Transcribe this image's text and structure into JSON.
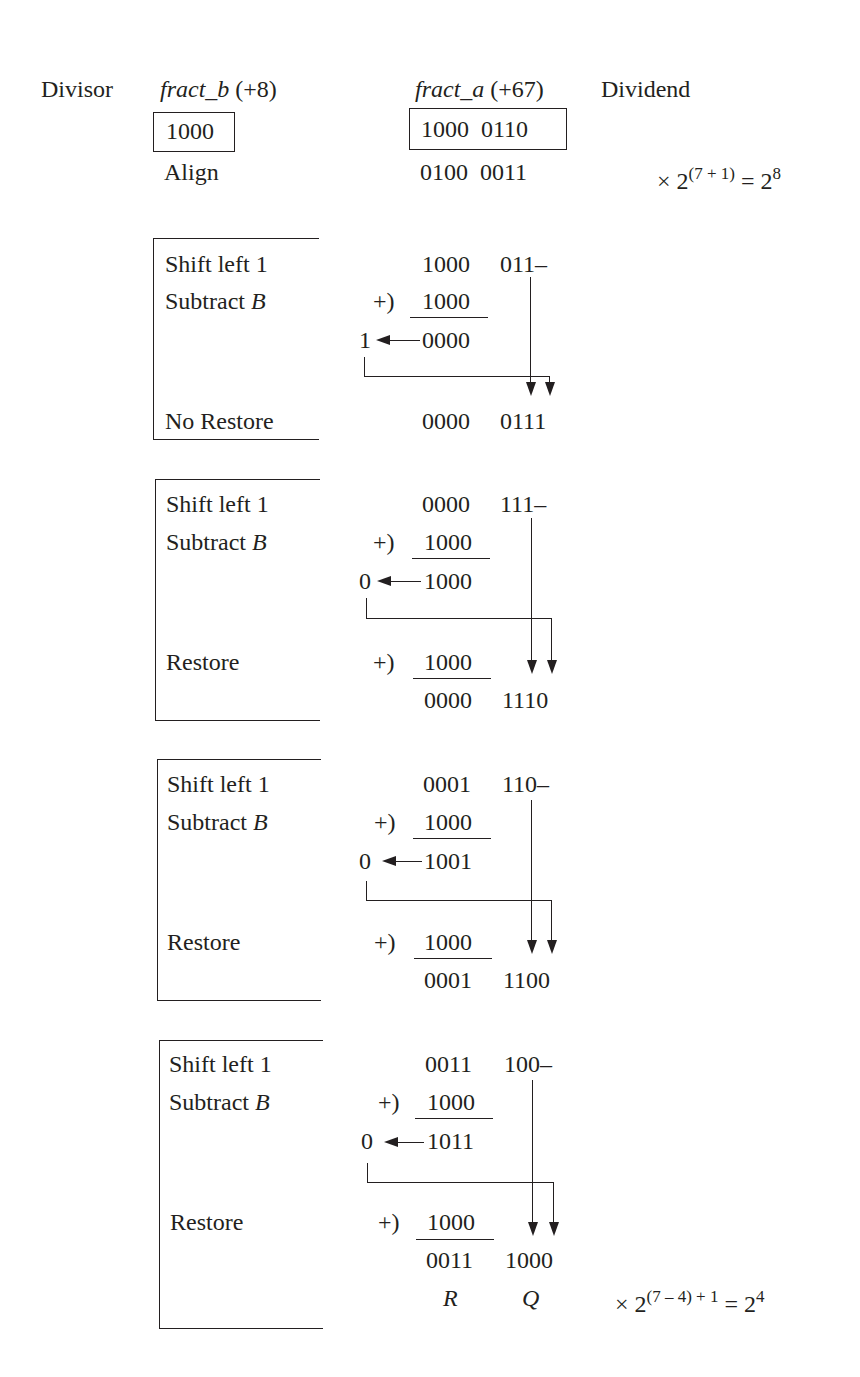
{
  "header": {
    "divisor_label": "Divisor",
    "dividend_label": "Dividend",
    "fract_b_name": "fract_b",
    "fract_b_value": "(+8)",
    "fract_a_name": "fract_a",
    "fract_a_value": "(+67)",
    "divisor_bits": "1000",
    "dividend_bits": "1000  0110",
    "align_label": "Align",
    "aligned_bits": "0100  0011",
    "scale_prefix": "× 2",
    "scale_exp": "(7 + 1)",
    "scale_eq": " = 2",
    "scale_result_exp": "8"
  },
  "steps": [
    {
      "shift_label": "Shift left 1",
      "subtract_label": "Subtract ",
      "subtract_var": "B",
      "shifted_hi": "1000",
      "shifted_lo": "011–",
      "add_op": "+)",
      "addend": "1000",
      "carry": "1",
      "sum": "0000",
      "restore_label": "No Restore",
      "restore_addend": "",
      "result_hi": "0000",
      "result_lo": "0111"
    },
    {
      "shift_label": "Shift left 1",
      "subtract_label": "Subtract ",
      "subtract_var": "B",
      "shifted_hi": "0000",
      "shifted_lo": "111–",
      "add_op": "+)",
      "addend": "1000",
      "carry": "0",
      "sum": "1000",
      "restore_label": "Restore",
      "restore_addend": "1000",
      "result_hi": "0000",
      "result_lo": "1110"
    },
    {
      "shift_label": "Shift left 1",
      "subtract_label": "Subtract ",
      "subtract_var": "B",
      "shifted_hi": "0001",
      "shifted_lo": "110–",
      "add_op": "+)",
      "addend": "1000",
      "carry": "0",
      "sum": "1001",
      "restore_label": "Restore",
      "restore_addend": "1000",
      "result_hi": "0001",
      "result_lo": "1100"
    },
    {
      "shift_label": "Shift left 1",
      "subtract_label": "Subtract ",
      "subtract_var": "B",
      "shifted_hi": "0011",
      "shifted_lo": "100–",
      "add_op": "+)",
      "addend": "1000",
      "carry": "0",
      "sum": "1011",
      "restore_label": "Restore",
      "restore_addend": "1000",
      "result_hi": "0011",
      "result_lo": "1000"
    }
  ],
  "footer": {
    "remainder_label": "R",
    "quotient_label": "Q",
    "scale_prefix": "× 2",
    "scale_exp": "(7 – 4) + 1",
    "scale_eq": " = 2",
    "scale_result_exp": "4"
  }
}
